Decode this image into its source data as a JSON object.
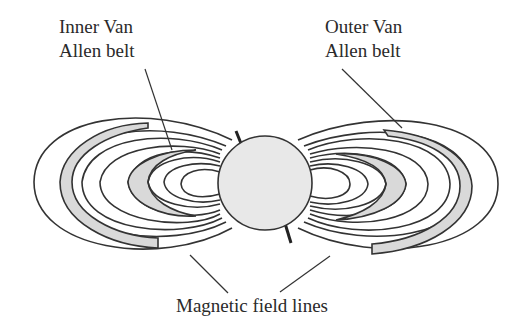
{
  "diagram": {
    "labels": {
      "inner_belt": [
        "Inner Van",
        "Allen belt"
      ],
      "outer_belt": [
        "Outer Van",
        "Allen belt"
      ],
      "field_lines": "Magnetic field lines"
    },
    "colors": {
      "earth_fill": "#e8e8e8",
      "belt_fill": "#d9d9d9",
      "line": "#333333",
      "background": "#ffffff"
    },
    "components": [
      {
        "name": "Earth",
        "shape": "circle",
        "center": [
          265,
          183
        ],
        "radius": 47
      },
      {
        "name": "Magnetic axis",
        "shape": "tilted line through Earth"
      },
      {
        "name": "Inner Van Allen belt",
        "shape": "shaded crescents on each side near Earth"
      },
      {
        "name": "Outer Van Allen belt",
        "shape": "shaded arcs on each side far from Earth"
      },
      {
        "name": "Magnetic field lines",
        "shape": "nested loops on left and right of Earth"
      }
    ]
  }
}
